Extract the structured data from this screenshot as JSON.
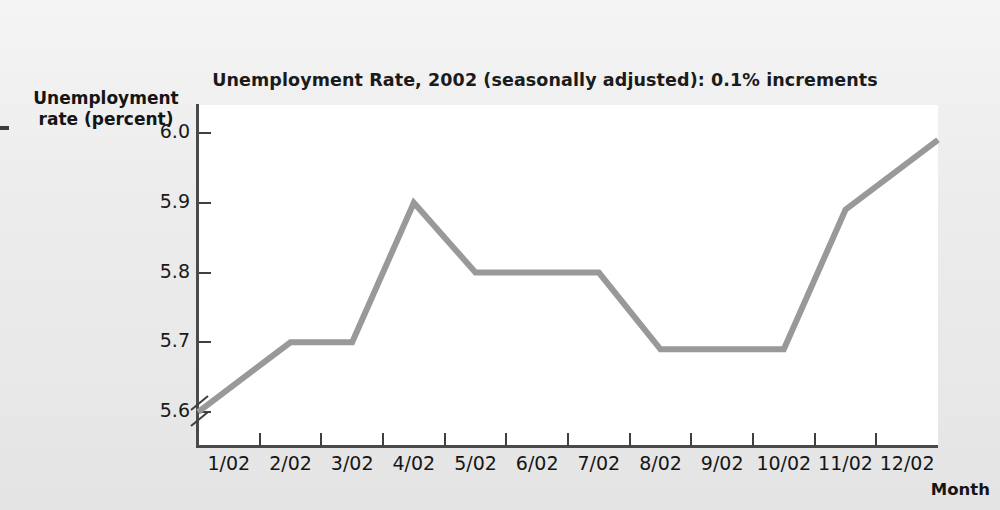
{
  "figure": {
    "title": "Unemployment Rate, 2002 (seasonally adjusted): 0.1% increments",
    "y_axis_title": "Unemployment\nrate (percent)",
    "y_axis_title_line1": "Unemployment",
    "y_axis_title_line2": "rate (percent)",
    "x_axis_title": "Month",
    "bleed_through_text": "",
    "line_color": "#999999",
    "axis_color": "#4a4a4a",
    "plot_background": "#ffffff",
    "page_background": "#ededed"
  },
  "chart_data": {
    "type": "line",
    "title": "Unemployment Rate, 2002 (seasonally adjusted): 0.1% increments",
    "xlabel": "Month",
    "ylabel": "Unemployment rate (percent)",
    "categories": [
      "1/02",
      "2/02",
      "3/02",
      "4/02",
      "5/02",
      "6/02",
      "7/02",
      "8/02",
      "9/02",
      "10/02",
      "11/02",
      "12/02"
    ],
    "values": [
      5.6,
      5.7,
      5.7,
      5.9,
      5.8,
      5.8,
      5.8,
      5.69,
      5.69,
      5.69,
      5.89,
      5.99
    ],
    "ylim": [
      5.55,
      6.04
    ],
    "yticks": [
      5.6,
      5.7,
      5.8,
      5.9,
      6.0
    ],
    "ytick_labels": [
      "5.6",
      "5.7",
      "5.8",
      "5.9",
      "6.0"
    ],
    "grid": false,
    "legend": null,
    "axis_break": true,
    "axis_break_note": "y-axis broken below 5.6",
    "series": [
      {
        "name": "Unemployment rate",
        "color": "#999999",
        "values": [
          5.6,
          5.7,
          5.7,
          5.9,
          5.8,
          5.8,
          5.8,
          5.69,
          5.69,
          5.69,
          5.89,
          5.99
        ]
      }
    ]
  }
}
